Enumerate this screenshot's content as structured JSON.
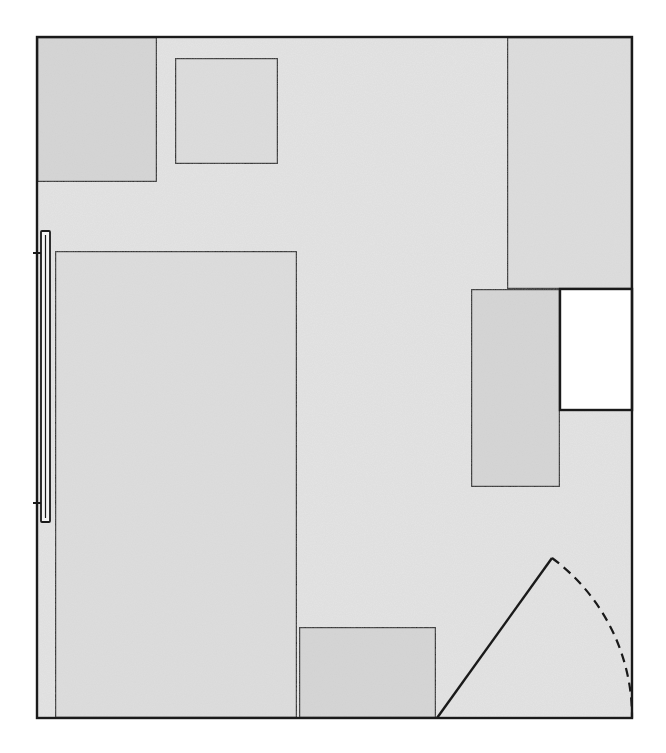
{
  "diagram": {
    "type": "floor-plan",
    "style": "pencil-shaded",
    "colors": {
      "background": "#ffffff",
      "floor_fill": "#e4e4e4",
      "furniture_fill": "#dedede",
      "dark_fill": "#d6d6d6",
      "open_fill": "#ffffff",
      "line": "#1a1a1a"
    },
    "room": {
      "x": 37,
      "y": 37,
      "w": 595,
      "h": 681
    },
    "elements": [
      {
        "id": "top-left-block",
        "x": 37,
        "y": 37,
        "w": 120,
        "h": 145,
        "fill": "dark"
      },
      {
        "id": "top-square",
        "x": 175,
        "y": 58,
        "w": 103,
        "h": 106,
        "fill": "furniture"
      },
      {
        "id": "top-right-tall-block",
        "x": 507,
        "y": 37,
        "w": 125,
        "h": 252,
        "fill": "furniture"
      },
      {
        "id": "large-rectangle",
        "x": 55,
        "y": 251,
        "w": 242,
        "h": 467,
        "fill": "furniture"
      },
      {
        "id": "desk-rectangle",
        "x": 471,
        "y": 289,
        "w": 89,
        "h": 198,
        "fill": "dark"
      },
      {
        "id": "open-box",
        "x": 560,
        "y": 289,
        "w": 72,
        "h": 121,
        "fill": "open"
      },
      {
        "id": "bottom-box",
        "x": 299,
        "y": 627,
        "w": 137,
        "h": 91,
        "fill": "dark"
      }
    ],
    "window": {
      "x": 41,
      "y": 231,
      "w": 9,
      "h": 291,
      "tick_top_y": 253,
      "tick_bottom_y": 503
    },
    "door": {
      "hinge": {
        "x": 437,
        "y": 718
      },
      "leaf_end": {
        "x": 552,
        "y": 558
      },
      "arc_end": {
        "x": 632,
        "y": 718
      },
      "arc_style": "dashed"
    }
  }
}
